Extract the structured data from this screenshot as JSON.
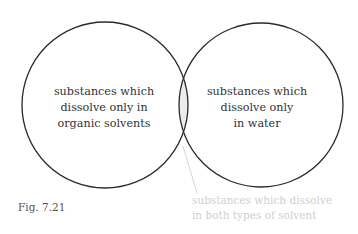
{
  "diagram": {
    "type": "venn",
    "left_set": {
      "lines": [
        "substances which",
        "dissolve only in",
        "organic solvents"
      ]
    },
    "right_set": {
      "lines": [
        "substances which",
        "dissolve only",
        "in water"
      ]
    },
    "intersection_callout": {
      "lines": [
        "substances which dissolve",
        "in both types of solvent"
      ]
    },
    "figure_label": "Fig. 7.21",
    "colors": {
      "outline": "#2a2a2a",
      "intersection_fill": "#ececec",
      "callout_text": "#cfcfcf",
      "leader_line": "#d0d0d0"
    }
  }
}
